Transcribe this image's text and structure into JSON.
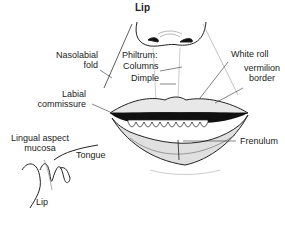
{
  "title": "Lip",
  "labels": {
    "nasolabial_1": "Nasolabial",
    "nasolabial_2": "fold",
    "philtrum": "Philtrum:",
    "columns": "Columns",
    "dimple": "Dimple",
    "white_roll": "White roll",
    "vermilion_1": "vermilion",
    "vermilion_2": "border",
    "labial_1": "Labial",
    "labial_2": "commissure",
    "lingual_1": "Lingual aspect",
    "lingual_2": "mucosa",
    "tongue": "Tongue",
    "lip_inset": "Lip",
    "frenulum": "Frenulum"
  }
}
